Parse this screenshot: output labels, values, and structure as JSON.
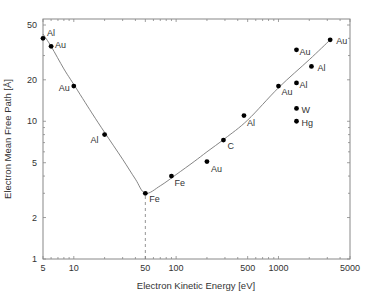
{
  "chart_data": {
    "type": "scatter",
    "title": "",
    "xlabel": "Electron Kinetic Energy  [eV]",
    "ylabel": "Electron Mean Free Path  [Å]",
    "xscale": "log",
    "yscale": "log",
    "xlim": [
      5,
      5000
    ],
    "ylim": [
      1,
      50
    ],
    "x_ticks": [
      5,
      10,
      50,
      100,
      500,
      1000,
      5000
    ],
    "x_tick_labels": [
      "5",
      "10",
      "50",
      "100",
      "500",
      "1000",
      "5000"
    ],
    "y_ticks": [
      1,
      2,
      5,
      10,
      20,
      50
    ],
    "y_tick_labels": [
      "1",
      "2",
      "5",
      "10",
      "20",
      "50"
    ],
    "grid": false,
    "points": [
      {
        "label": "Al",
        "x": 5,
        "y": 40
      },
      {
        "label": "Au",
        "x": 6,
        "y": 35
      },
      {
        "label": "Au",
        "x": 10,
        "y": 18
      },
      {
        "label": "Al",
        "x": 20,
        "y": 8
      },
      {
        "label": "Fe",
        "x": 50,
        "y": 3
      },
      {
        "label": "Fe",
        "x": 90,
        "y": 4
      },
      {
        "label": "Au",
        "x": 200,
        "y": 5.1
      },
      {
        "label": "C",
        "x": 290,
        "y": 7.3
      },
      {
        "label": "Al",
        "x": 460,
        "y": 11
      },
      {
        "label": "Au",
        "x": 1000,
        "y": 18
      },
      {
        "label": "Au",
        "x": 3200,
        "y": 39
      },
      {
        "label": "Au",
        "x": 1500,
        "y": 33
      },
      {
        "label": "Al",
        "x": 2100,
        "y": 25
      },
      {
        "label": "Al",
        "x": 1500,
        "y": 19
      },
      {
        "label": "W",
        "x": 1500,
        "y": 12.4
      },
      {
        "label": "Hg",
        "x": 1500,
        "y": 10
      }
    ],
    "curve": {
      "name": "universal curve",
      "x": [
        5,
        6,
        8,
        10,
        15,
        20,
        30,
        40,
        50,
        70,
        100,
        150,
        200,
        300,
        500,
        1000,
        2000,
        3200
      ],
      "y": [
        43,
        35,
        24,
        18.5,
        11.5,
        8.3,
        5.3,
        3.8,
        3.0,
        3.4,
        4.1,
        5.1,
        6.0,
        7.5,
        10.2,
        17.5,
        28,
        39
      ]
    },
    "annotations": [
      {
        "type": "dashed-vline",
        "x": 50,
        "from_y": 1,
        "to_y": 3
      }
    ]
  },
  "colors": {
    "axis": "#888888",
    "curve": "#777777",
    "point": "#000000",
    "text": "#333333"
  }
}
